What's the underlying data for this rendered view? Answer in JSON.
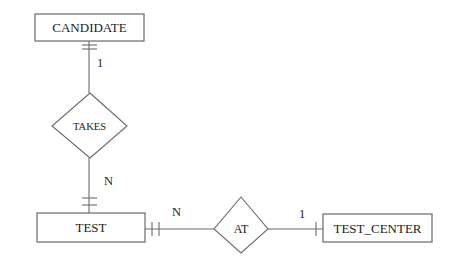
{
  "diagram": {
    "type": "er-diagram",
    "entities": [
      {
        "id": "candidate",
        "label": "CANDIDATE"
      },
      {
        "id": "test",
        "label": "TEST"
      },
      {
        "id": "test_center",
        "label": "TEST_CENTER"
      }
    ],
    "relationships": [
      {
        "id": "takes",
        "label": "TAKES",
        "from": "CANDIDATE",
        "to": "TEST",
        "from_cardinality": "1",
        "to_cardinality": "N"
      },
      {
        "id": "at",
        "label": "AT",
        "from": "TEST",
        "to": "TEST_CENTER",
        "from_cardinality": "N",
        "to_cardinality": "1"
      }
    ],
    "cardinalities": {
      "candidate_takes": "1",
      "takes_test": "N",
      "test_at": "N",
      "at_test_center": "1"
    },
    "colors": {
      "stroke": "#6a6a6a",
      "text": "#222222",
      "background": "#ffffff"
    }
  }
}
